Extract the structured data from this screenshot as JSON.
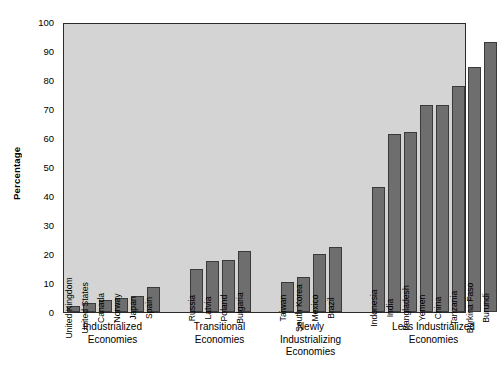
{
  "chart_data": {
    "type": "bar",
    "title": "",
    "xlabel": "",
    "ylabel": "Percentage",
    "ylim": [
      0,
      100
    ],
    "ytick_labels": [
      "0",
      "10",
      "20",
      "30",
      "40",
      "50",
      "60",
      "70",
      "80",
      "90",
      "100"
    ],
    "ytick_values": [
      0,
      10,
      20,
      30,
      40,
      50,
      60,
      70,
      80,
      90,
      100
    ],
    "grid": false,
    "legend": "none",
    "bar_color": "#6e6e6e",
    "plot_background": "#d4d4d4",
    "axis_color": "#2b2b2b",
    "categories": [
      "United Kingdom",
      "United States",
      "Canada",
      "Norway",
      "Japan",
      "Spain",
      "Russia",
      "Latvia",
      "Poland",
      "Bulgaria",
      "Taiwan",
      "South Korea",
      "Mexico",
      "Brazil",
      "Indonesia",
      "India",
      "Bangladesh",
      "Yemen",
      "China",
      "Tanzania",
      "Burkina Faso",
      "Burundi"
    ],
    "values": [
      2,
      3,
      4,
      5,
      5.5,
      8.5,
      15,
      17.5,
      18,
      21,
      10.5,
      12,
      20,
      22.5,
      43,
      61.5,
      62,
      71.5,
      71.5,
      78,
      84.5,
      93
    ],
    "groups": [
      {
        "label": "Industrialized\nEconomies",
        "bars": [
          {
            "name": "United Kingdom",
            "value": 2
          },
          {
            "name": "United States",
            "value": 3
          },
          {
            "name": "Canada",
            "value": 4
          },
          {
            "name": "Norway",
            "value": 5
          },
          {
            "name": "Japan",
            "value": 5.5
          },
          {
            "name": "Spain",
            "value": 8.5
          }
        ]
      },
      {
        "label": "Transitional\nEconomies",
        "bars": [
          {
            "name": "Russia",
            "value": 15
          },
          {
            "name": "Latvia",
            "value": 17.5
          },
          {
            "name": "Poland",
            "value": 18
          },
          {
            "name": "Bulgaria",
            "value": 21
          }
        ]
      },
      {
        "label": "Newly\nIndustrializing\nEconomies",
        "bars": [
          {
            "name": "Taiwan",
            "value": 10.5
          },
          {
            "name": "South Korea",
            "value": 12
          },
          {
            "name": "Mexico",
            "value": 20
          },
          {
            "name": "Brazil",
            "value": 22.5
          }
        ]
      },
      {
        "label": "Less Industrialized\nEconomies",
        "bars": [
          {
            "name": "Indonesia",
            "value": 43
          },
          {
            "name": "India",
            "value": 61.5
          },
          {
            "name": "Bangladesh",
            "value": 62
          },
          {
            "name": "Yemen",
            "value": 71.5
          },
          {
            "name": "China",
            "value": 71.5
          },
          {
            "name": "Tanzania",
            "value": 78
          },
          {
            "name": "Burkina Faso",
            "value": 84.5
          },
          {
            "name": "Burundi",
            "value": 93
          }
        ]
      }
    ]
  }
}
